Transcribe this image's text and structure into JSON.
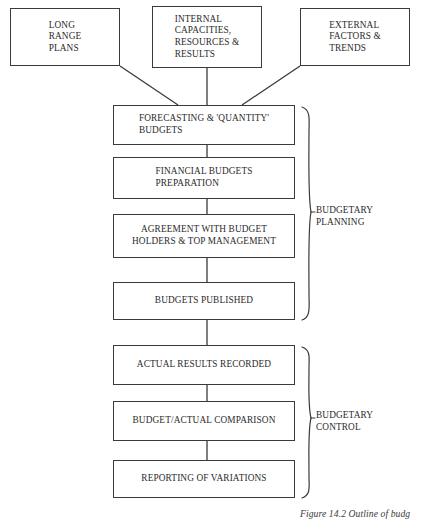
{
  "figure": {
    "caption": "Figure 14.2  Outline of budg"
  },
  "sources": [
    {
      "id": "long-range-plans",
      "text": "LONG\nRANGE\nPLANS"
    },
    {
      "id": "internal-capacities",
      "text": "INTERNAL\nCAPACITIES,\nRESOURCES &\nRESULTS"
    },
    {
      "id": "external-factors",
      "text": "EXTERNAL\nFACTORS &\nTRENDS"
    }
  ],
  "process_steps": [
    {
      "id": "forecasting",
      "text": "FORECASTING & 'QUANTITY'\nBUDGETS",
      "group": "budgetary-planning"
    },
    {
      "id": "financial-budgets",
      "text": "FINANCIAL BUDGETS\nPREPARATION",
      "group": "budgetary-planning"
    },
    {
      "id": "agreement",
      "text": "AGREEMENT WITH BUDGET\nHOLDERS & TOP MANAGEMENT",
      "group": "budgetary-planning"
    },
    {
      "id": "budgets-published",
      "text": "BUDGETS PUBLISHED",
      "group": "budgetary-planning"
    },
    {
      "id": "actual-results",
      "text": "ACTUAL RESULTS RECORDED",
      "group": "budgetary-control"
    },
    {
      "id": "budget-actual-comparison",
      "text": "BUDGET/ACTUAL COMPARISON",
      "group": "budgetary-control"
    },
    {
      "id": "reporting-variations",
      "text": "REPORTING OF VARIATIONS",
      "group": "budgetary-control"
    }
  ],
  "groups": [
    {
      "id": "budgetary-planning",
      "label": "BUDGETARY\nPLANNING"
    },
    {
      "id": "budgetary-control",
      "label": "BUDGETARY\nCONTROL"
    }
  ],
  "colors": {
    "stroke": "#3a3a3a",
    "text": "#2b2b2b",
    "background": "#ffffff"
  }
}
